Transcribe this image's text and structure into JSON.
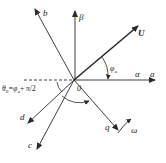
{
  "diagram": {
    "type": "vector-diagram",
    "colors": {
      "line": "#2a2a2a",
      "background": "#ffffff"
    },
    "origin_label": "0",
    "axes": [
      {
        "id": "alpha",
        "label": "α"
      },
      {
        "id": "a",
        "label": "a"
      },
      {
        "id": "beta",
        "label": "β"
      },
      {
        "id": "b",
        "label": "b"
      },
      {
        "id": "c",
        "label": "c"
      },
      {
        "id": "d",
        "label": "d"
      },
      {
        "id": "q",
        "label": "q"
      }
    ],
    "vector": {
      "id": "U",
      "label": "U"
    },
    "angles": {
      "phi_u": "φ",
      "phi_u_sub": "u",
      "theta0": "θ",
      "theta0_sub": "0",
      "theta0_rhs": "=φ",
      "theta0_rhs_sub": "u",
      "theta0_tail": "+ π/2"
    },
    "rotation": {
      "label": "ω"
    }
  }
}
